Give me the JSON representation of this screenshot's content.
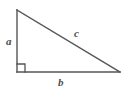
{
  "figure": {
    "kind": "right-triangle-diagram",
    "background_color": "#ffffff",
    "stroke_color": "#555555",
    "label_color": "#4d4d4d",
    "labels": {
      "leg_vertical": "a",
      "leg_horizontal": "b",
      "hypotenuse": "c"
    },
    "right_angle_marker": {
      "present": true,
      "size_px": 8,
      "at_vertex": "bottom-left"
    },
    "vertices": {
      "top_left": {
        "x": 17,
        "y": 10
      },
      "bottom_left": {
        "x": 17,
        "y": 72
      },
      "bottom_right": {
        "x": 120,
        "y": 72
      }
    }
  }
}
